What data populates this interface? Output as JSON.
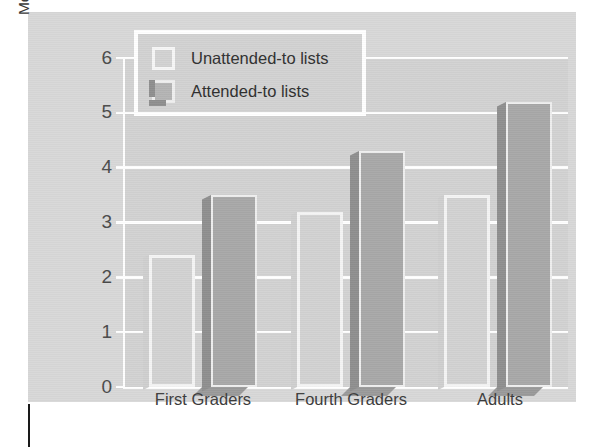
{
  "chart_data": {
    "type": "bar",
    "title": "",
    "xlabel": "",
    "ylabel_line1": "Mean Number Correctly Recalled",
    "ylabel_line2": "(Memory Span)",
    "categories": [
      "First Graders",
      "Fourth Graders",
      "Adults"
    ],
    "series": [
      {
        "name": "Unattended-to lists",
        "values": [
          2.4,
          3.2,
          3.5
        ],
        "color": "#d2d2d2"
      },
      {
        "name": "Attended-to lists",
        "values": [
          3.5,
          4.3,
          5.2
        ],
        "color": "#a8a8a8"
      }
    ],
    "ylim": [
      0,
      6
    ],
    "yticks": [
      0,
      1,
      2,
      3,
      4,
      5,
      6
    ],
    "ytick_labels": [
      "0",
      "1",
      "2",
      "3",
      "4",
      "5",
      "6"
    ],
    "grid": true,
    "grid_color": "#ffffff",
    "legend_position": "top-left-inset",
    "background_color": "#d8d8d8",
    "plot_background_color": "#d2d2d2"
  },
  "legend": {
    "items": [
      {
        "label": "Unattended-to lists",
        "swatch": "light-square-swatch"
      },
      {
        "label": "Attended-to lists",
        "swatch": "dark-square-swatch"
      }
    ]
  },
  "axes": {
    "y_title": {
      "line1": "Mean Number Correctly Recalled",
      "line2": "(Memory Span)"
    },
    "y_tick_labels": [
      "6",
      "5",
      "4",
      "3",
      "2",
      "1",
      "0"
    ],
    "x_tick_labels": [
      "First Graders",
      "Fourth Graders",
      "Adults"
    ]
  },
  "caption": {
    "text": ""
  }
}
